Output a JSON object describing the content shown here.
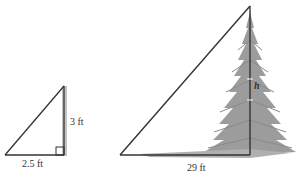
{
  "small_triangle": {
    "height_label": "3 ft",
    "base_label": "2.5 ft"
  },
  "large_triangle": {
    "height_label": "h",
    "base_label": "29 ft"
  },
  "colors": {
    "line": "#333333",
    "tree": "#9a9a9a",
    "pole": "#b8b8b8"
  }
}
